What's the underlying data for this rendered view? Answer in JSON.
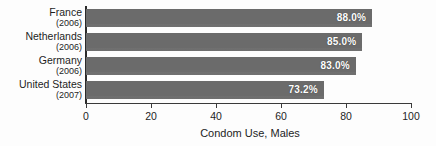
{
  "chart_data": {
    "type": "bar",
    "orientation": "horizontal",
    "title": "",
    "xlabel": "Condom Use, Males",
    "ylabel": "",
    "xlim": [
      0,
      100
    ],
    "xticks": [
      "0",
      "20",
      "40",
      "60",
      "80",
      "100"
    ],
    "grid": false,
    "legend": null,
    "bar_color": "#6f6f6f",
    "label_color": "#ffffff",
    "categories": [
      "France",
      "Netherlands",
      "Germany",
      "United States"
    ],
    "category_years": [
      "(2006)",
      "(2006)",
      "(2006)",
      "(2007)"
    ],
    "values": [
      88.0,
      85.0,
      83.0,
      73.2
    ],
    "value_labels": [
      "88.0%",
      "85.0%",
      "83.0%",
      "73.2%"
    ]
  }
}
